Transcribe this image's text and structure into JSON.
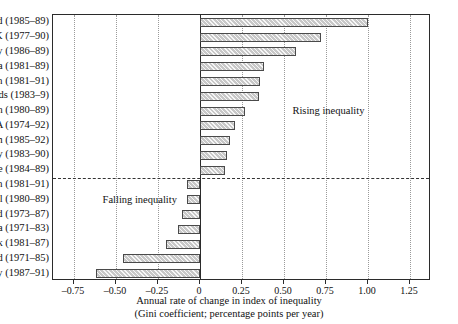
{
  "chart_data": {
    "type": "bar",
    "orientation": "horizontal",
    "title": "",
    "xlabel_line1": "Annual rate of change in index of inequality",
    "xlabel_line2": "(Gini coefficient; percentage points per year)",
    "ylabel": "",
    "xlim": [
      -0.875,
      1.375
    ],
    "xticks": [
      -0.75,
      -0.5,
      -0.25,
      0,
      0.25,
      0.5,
      0.75,
      1.0,
      1.25
    ],
    "xtick_labels": [
      "–0.75",
      "–0.50",
      "–0.25",
      "0",
      "0.25",
      "0.50",
      "0.75",
      "1.00",
      "1.25"
    ],
    "grid": true,
    "grid_style": "dotted-vertical",
    "legend": "none",
    "zero_line": true,
    "categories": [
      "New Zealand (1985–89)",
      "UK (1977–90)",
      "Norway (1986–89)",
      "Australia (1981–89)",
      "Sweden (1981–91)",
      "Netherlands (1983–9)",
      "Japan (1980–89)",
      "USA (1974–92)",
      "Belgium (1985–92)",
      "West Germany (1983–90)",
      "France (1984–89)",
      "Spain (1981–91)",
      "Portugal (1980–89)",
      "Ireland (1973–87)",
      "Canada (1971–83)",
      "Denmark (1981–87)",
      "Finland (1971–85)",
      "Italy (1987–91)"
    ],
    "values": [
      1.0,
      0.72,
      0.57,
      0.38,
      0.36,
      0.35,
      0.27,
      0.21,
      0.18,
      0.16,
      0.15,
      -0.08,
      -0.08,
      -0.11,
      -0.13,
      -0.2,
      -0.46,
      -0.62
    ],
    "annotations": [
      {
        "text": "Rising inequality",
        "x": 0.55,
        "category_index": 6
      },
      {
        "text": "Falling inequality",
        "x": -0.58,
        "category_index": 12
      }
    ],
    "separator_after_category": "France (1984–89)"
  },
  "colors": {
    "bar_fill": "#c8c8c8",
    "bar_border": "#4a4a4a",
    "axis": "#2b2b2b",
    "grid": "#9a9a9a",
    "text": "#111111",
    "background": "#ffffff"
  }
}
